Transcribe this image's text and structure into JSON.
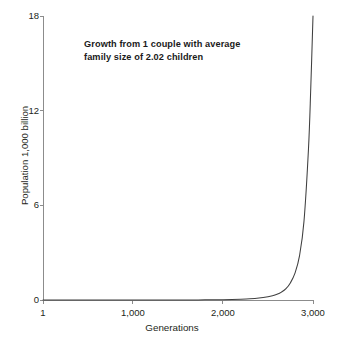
{
  "chart_data": {
    "type": "line",
    "title": "Growth from 1 couple with average\nfamily size of 2.02 children",
    "xlabel": "Generations",
    "ylabel": "Population 1,000 billion",
    "xlim": [
      1,
      3000
    ],
    "ylim": [
      0,
      18
    ],
    "xticks": [
      1,
      1000,
      2000,
      3000
    ],
    "xticklabels": [
      "1",
      "1,000",
      "2,000",
      "3,000"
    ],
    "yticks": [
      0,
      6,
      12,
      18
    ],
    "yticklabels": [
      "0",
      "6",
      "12",
      "18"
    ],
    "grid": false,
    "legend": "none",
    "series": [
      {
        "name": "Population",
        "x": [
          1,
          200,
          400,
          600,
          800,
          1000,
          1200,
          1400,
          1600,
          1800,
          2000,
          2100,
          2200,
          2300,
          2400,
          2500,
          2550,
          2600,
          2650,
          2700,
          2750,
          2800,
          2850,
          2900,
          2950,
          2975,
          3000
        ],
        "y": [
          0.0,
          0.0,
          0.0,
          0.0,
          0.0,
          0.0,
          0.0,
          0.0,
          0.0,
          0.01,
          0.02,
          0.03,
          0.05,
          0.08,
          0.13,
          0.21,
          0.27,
          0.36,
          0.5,
          0.72,
          1.1,
          1.7,
          2.8,
          5.0,
          9.6,
          13.4,
          18.0
        ]
      }
    ],
    "colors": {
      "line": "#3f3f3f",
      "axis": "#6e6e6e",
      "text": "#231f20",
      "background": "#ffffff"
    },
    "geometry": {
      "plot_left": 43,
      "plot_right": 313,
      "plot_top": 16,
      "plot_bottom": 300
    }
  }
}
